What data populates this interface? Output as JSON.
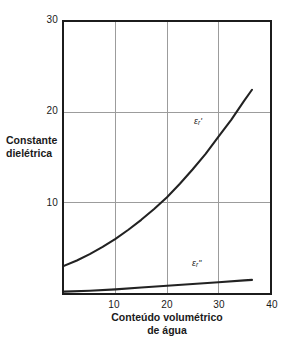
{
  "figure": {
    "background_color": "#ffffff",
    "frame_color": "#1c1c1c",
    "grid_color": "#9a9a9a",
    "curve_color": "#222222"
  },
  "axes": {
    "y": {
      "title_line1": "Constante",
      "title_line2": "dielétrica",
      "ticks": [
        "10",
        "20",
        "30"
      ],
      "tick_values": [
        10,
        20,
        30
      ],
      "range": [
        0,
        30
      ]
    },
    "x": {
      "title_line1": "Conteúdo volumétrico",
      "title_line2": "de água",
      "ticks": [
        "10",
        "20",
        "30",
        "40"
      ],
      "tick_values": [
        10,
        20,
        30,
        40
      ],
      "range": [
        0,
        40
      ]
    }
  },
  "annotations": {
    "eps_real": {
      "symbol": "ε",
      "subscript": "r",
      "prime": "'"
    },
    "eps_imag": {
      "symbol": "ε",
      "subscript": "r",
      "prime": "''"
    }
  },
  "chart_data": {
    "type": "line",
    "title": "",
    "xlabel": "Conteúdo volumétrico de água",
    "ylabel": "Constante dielétrica",
    "xlim": [
      0,
      40
    ],
    "ylim": [
      0,
      30
    ],
    "xticks": [
      10,
      20,
      30,
      40
    ],
    "yticks": [
      10,
      20,
      30
    ],
    "grid": true,
    "legend": "inline-annotations",
    "series": [
      {
        "name": "εr'",
        "label": "εr'",
        "x": [
          0,
          2.5,
          5,
          7.5,
          10,
          12.5,
          15,
          17.5,
          20,
          22.5,
          25,
          27.5,
          30,
          32.5,
          35,
          36.5
        ],
        "values": [
          3.0,
          3.6,
          4.3,
          5.1,
          6.0,
          7.0,
          8.1,
          9.3,
          10.6,
          12.1,
          13.7,
          15.4,
          17.3,
          19.2,
          21.3,
          22.5
        ]
      },
      {
        "name": "εr''",
        "label": "εr''",
        "x": [
          0,
          5,
          10,
          15,
          20,
          25,
          30,
          35,
          36.5
        ],
        "values": [
          0.15,
          0.25,
          0.4,
          0.6,
          0.8,
          1.0,
          1.2,
          1.4,
          1.45
        ]
      }
    ]
  }
}
